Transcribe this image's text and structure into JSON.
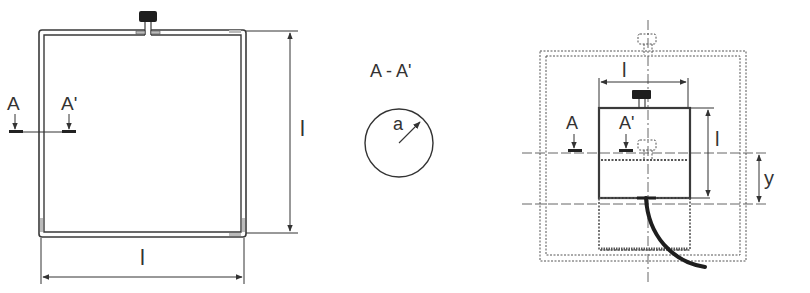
{
  "figure": {
    "colors": {
      "stroke": "#3a3a3a",
      "fill_dark": "#1e1e1e",
      "dashed": "#555555",
      "background": "#ffffff"
    },
    "loop_view": {
      "section_label_left": "A",
      "section_label_right": "A'",
      "dimension_height": "l",
      "dimension_width": "l"
    },
    "cross_section": {
      "title": "A - A'",
      "radius_label": "a"
    },
    "test_setup": {
      "dimension_width": "l",
      "dimension_height": "l",
      "section_label_left": "A",
      "section_label_right": "A'",
      "offset_label": "y"
    }
  }
}
